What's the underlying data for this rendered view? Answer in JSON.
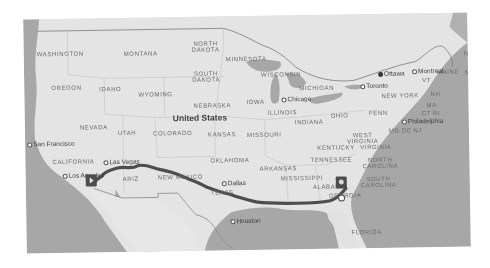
{
  "map": {
    "country_label": "United States",
    "state_labels": [
      {
        "id": "washington",
        "text": "WASHINGTON",
        "x": 13,
        "y": 32
      },
      {
        "id": "montana",
        "text": "MONTANA",
        "x": 100,
        "y": 33
      },
      {
        "id": "north-dakota",
        "text": "NORTH\nDAKOTA",
        "x": 168,
        "y": 24
      },
      {
        "id": "minnesota",
        "text": "MINNESOTA",
        "x": 202,
        "y": 40
      },
      {
        "id": "oregon",
        "text": "OREGON",
        "x": 27,
        "y": 66
      },
      {
        "id": "idaho",
        "text": "IDAHO",
        "x": 75,
        "y": 68
      },
      {
        "id": "wyoming",
        "text": "WYOMING",
        "x": 114,
        "y": 74
      },
      {
        "id": "south-dakota",
        "text": "SOUTH\nDAKOTA",
        "x": 168,
        "y": 54
      },
      {
        "id": "wisconsin",
        "text": "WISCONSIN",
        "x": 237,
        "y": 56
      },
      {
        "id": "michigan",
        "text": "MICHIGAN",
        "x": 275,
        "y": 70
      },
      {
        "id": "iowa",
        "text": "IOWA",
        "x": 222,
        "y": 83
      },
      {
        "id": "nebraska",
        "text": "NEBRASKA",
        "x": 169,
        "y": 86
      },
      {
        "id": "illinois",
        "text": "ILLINOIS",
        "x": 243,
        "y": 94
      },
      {
        "id": "indiana",
        "text": "INDIANA",
        "x": 270,
        "y": 104
      },
      {
        "id": "ohio",
        "text": "OHIO",
        "x": 306,
        "y": 98
      },
      {
        "id": "penn",
        "text": "PENN",
        "x": 344,
        "y": 96
      },
      {
        "id": "new-york",
        "text": "NEW YORK",
        "x": 357,
        "y": 79
      },
      {
        "id": "vt",
        "text": "VT",
        "x": 398,
        "y": 64
      },
      {
        "id": "nh",
        "text": "NH",
        "x": 406,
        "y": 78
      },
      {
        "id": "maine",
        "text": "MAINE",
        "x": 413,
        "y": 56
      },
      {
        "id": "nb",
        "text": "NB",
        "x": 440,
        "y": 38
      },
      {
        "id": "nova",
        "text": "NOVA",
        "x": 441,
        "y": 57
      },
      {
        "id": "ma",
        "text": "MA",
        "x": 402,
        "y": 89
      },
      {
        "id": "ct-ri",
        "text": "CT RI",
        "x": 397,
        "y": 97
      },
      {
        "id": "md-de-nj",
        "text": "MD DE NJ",
        "x": 364,
        "y": 114
      },
      {
        "id": "nevada",
        "text": "NEVADA",
        "x": 55,
        "y": 106
      },
      {
        "id": "utah",
        "text": "UTAH",
        "x": 93,
        "y": 112
      },
      {
        "id": "colorado",
        "text": "COLORADO",
        "x": 128,
        "y": 113
      },
      {
        "id": "kansas",
        "text": "KANSAS",
        "x": 183,
        "y": 115
      },
      {
        "id": "missouri",
        "text": "MISSOURI",
        "x": 222,
        "y": 116
      },
      {
        "id": "west-virginia",
        "text": "WEST\nVIRGINIA",
        "x": 322,
        "y": 118
      },
      {
        "id": "kentucky",
        "text": "KENTUCKY",
        "x": 292,
        "y": 130
      },
      {
        "id": "virginia",
        "text": "VIRGINIA",
        "x": 335,
        "y": 130
      },
      {
        "id": "california",
        "text": "CALIFORNIA",
        "x": 27,
        "y": 140
      },
      {
        "id": "oklahoma",
        "text": "OKLAHOMA",
        "x": 185,
        "y": 141
      },
      {
        "id": "tennessee",
        "text": "TENNESSEE",
        "x": 285,
        "y": 142
      },
      {
        "id": "north-carolina",
        "text": "NORTH\nCAROLINA",
        "x": 337,
        "y": 143
      },
      {
        "id": "arkansas",
        "text": "ARKANSAS",
        "x": 234,
        "y": 150
      },
      {
        "id": "mississippi",
        "text": "MISSISSIPPI",
        "x": 255,
        "y": 160
      },
      {
        "id": "south-carolina",
        "text": "SOUTH\nCAROLINA",
        "x": 335,
        "y": 162
      },
      {
        "id": "alabama",
        "text": "ALABAMA",
        "x": 287,
        "y": 169
      },
      {
        "id": "new-mexico",
        "text": "NEW MEXICO",
        "x": 132,
        "y": 157
      },
      {
        "id": "arizona",
        "text": "ARIZ",
        "x": 97,
        "y": 158
      },
      {
        "id": "texas",
        "text": "TEXAS",
        "x": 185,
        "y": 173
      },
      {
        "id": "georgia",
        "text": "GEORGIA",
        "x": 303,
        "y": 178
      },
      {
        "id": "florida",
        "text": "FLORIDA",
        "x": 325,
        "y": 215
      }
    ],
    "city_labels": [
      {
        "id": "ottawa",
        "text": "Ottawa",
        "x": 354,
        "y": 56,
        "capital": true
      },
      {
        "id": "montreal",
        "text": "Montreal",
        "x": 388,
        "y": 54,
        "capital": false
      },
      {
        "id": "toronto",
        "text": "Toronto",
        "x": 336,
        "y": 68,
        "capital": false
      },
      {
        "id": "chicago",
        "text": "Chicago",
        "x": 257,
        "y": 80,
        "capital": false
      },
      {
        "id": "philadelphia",
        "text": "Philadelphia",
        "x": 377,
        "y": 104,
        "capital": false
      },
      {
        "id": "san-francisco",
        "text": "San Francisco",
        "x": 2,
        "y": 121,
        "capital": false
      },
      {
        "id": "las-vegas",
        "text": "Las Vegas",
        "x": 78,
        "y": 140,
        "capital": false
      },
      {
        "id": "los-angeles",
        "text": "Los Angeles",
        "x": 37,
        "y": 153,
        "capital": false
      },
      {
        "id": "dallas",
        "text": "Dallas",
        "x": 196,
        "y": 163,
        "capital": false
      },
      {
        "id": "houston",
        "text": "Houston",
        "x": 204,
        "y": 201,
        "capital": false
      }
    ],
    "route": {
      "origin": "Los Angeles",
      "destination": "Savannah area, Georgia",
      "origin_icon": "origin-marker-icon",
      "destination_icon": "destination-marker-icon"
    },
    "colors": {
      "land": "#e8e8e8",
      "water": "#a8a8a8",
      "route": "#4a4a4a",
      "border": "#9a9a9a"
    }
  }
}
